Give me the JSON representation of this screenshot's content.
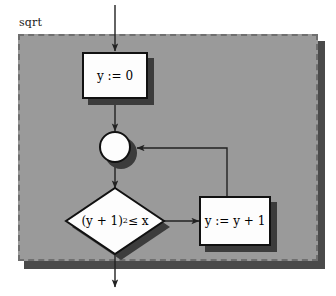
{
  "diagram": {
    "panel_label": "sqrt",
    "colors": {
      "panel_fill": "#9a9a9a",
      "panel_border": "#6f6f6f",
      "shadow": "#3c3c3c",
      "shape_fill": "#fdfdfd",
      "shape_border": "#111111",
      "connector": "#222222",
      "page_background": "#ffffff"
    },
    "nodes": {
      "init_box": {
        "label": "y := 0",
        "type": "process"
      },
      "merge_node": {
        "label": "",
        "type": "merge-junction"
      },
      "decision": {
        "label_prefix": "(y + 1)",
        "label_exponent": "2",
        "label_suffix": " ≤ x",
        "label_full": "(y + 1)2 ≤ x",
        "type": "decision"
      },
      "increment_box": {
        "label": "y := y + 1",
        "type": "process"
      }
    },
    "edges": {
      "entry": {
        "from": "start",
        "to": "init_box"
      },
      "init_to_merge": {
        "from": "init_box",
        "to": "merge_node"
      },
      "merge_to_decision": {
        "from": "merge_node",
        "to": "decision"
      },
      "decision_to_increment": {
        "from": "decision",
        "to": "increment_box"
      },
      "increment_to_merge": {
        "from": "increment_box",
        "to": "merge_node"
      },
      "exit": {
        "from": "decision",
        "to": "end"
      }
    }
  }
}
